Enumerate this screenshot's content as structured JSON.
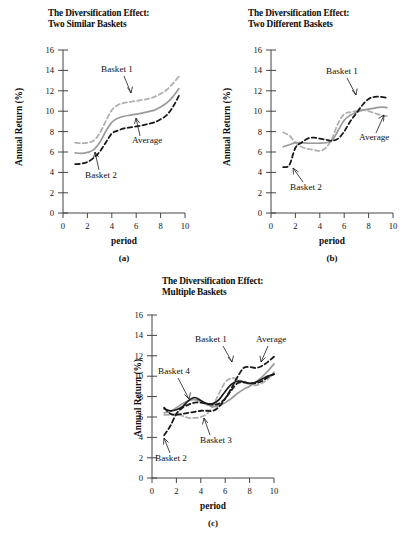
{
  "figure": {
    "background": "#ffffff",
    "common_axis": {
      "xlabel": "period",
      "ylabel": "Annual Return (%)",
      "xticks": [
        "0",
        "2",
        "4",
        "6",
        "8",
        "10"
      ],
      "yticks": [
        "0",
        "2",
        "4",
        "6",
        "8",
        "10",
        "12",
        "14",
        "16"
      ],
      "xlim": [
        0,
        10
      ],
      "ylim": [
        0,
        16
      ]
    },
    "colors": {
      "black": "#1a1a1a",
      "gray": "#9a9a9a",
      "light_gray": "#b0b0b0",
      "axis": "#444444"
    }
  },
  "panels": [
    {
      "id": "a",
      "caption": "(a)",
      "title": "The Diversification Effect:\nTwo Similar Baskets",
      "xlabel": "period",
      "ylabel": "Annual Return (%)",
      "annotations": [
        {
          "name": "basket-1",
          "text": "Basket 1"
        },
        {
          "name": "basket-2",
          "text": "Basket 2"
        },
        {
          "name": "average",
          "text": "Average"
        }
      ]
    },
    {
      "id": "b",
      "caption": "(b)",
      "title": "The Diversification Effect:\nTwo Different Baskets",
      "xlabel": "period",
      "ylabel": "Annual Return (%)",
      "annotations": [
        {
          "name": "basket-1",
          "text": "Basket 1"
        },
        {
          "name": "basket-2",
          "text": "Basket 2"
        },
        {
          "name": "average",
          "text": "Average"
        }
      ]
    },
    {
      "id": "c",
      "caption": "(c)",
      "title": "The Diversification Effect:\nMultiple Baskets",
      "xlabel": "period",
      "ylabel": "Annual Return (%)",
      "annotations": [
        {
          "name": "basket-1",
          "text": "Basket 1"
        },
        {
          "name": "basket-2",
          "text": "Basket 2"
        },
        {
          "name": "basket-3",
          "text": "Basket 3"
        },
        {
          "name": "basket-4",
          "text": "Basket 4"
        },
        {
          "name": "average",
          "text": "Average"
        }
      ]
    }
  ],
  "chart_data": [
    {
      "type": "line",
      "panel": "a",
      "title": "The Diversification Effect: Two Similar Baskets",
      "xlabel": "period",
      "ylabel": "Annual Return (%)",
      "xlim": [
        0,
        10
      ],
      "ylim": [
        0,
        16
      ],
      "xticks": [
        0,
        2,
        4,
        6,
        8,
        10
      ],
      "yticks": [
        0,
        2,
        4,
        6,
        8,
        10,
        12,
        14,
        16
      ],
      "grid": false,
      "legend": "inline-annotations",
      "x": [
        1.0,
        1.5,
        2.0,
        2.5,
        3.0,
        3.5,
        4.0,
        4.5,
        5.0,
        5.5,
        6.0,
        6.5,
        7.0,
        7.5,
        8.0,
        8.5,
        9.0,
        9.5
      ],
      "series": [
        {
          "name": "Basket 1",
          "style": "dashed",
          "color": "#b0b0b0",
          "values": [
            6.9,
            6.85,
            6.9,
            7.1,
            7.8,
            9.0,
            10.1,
            10.6,
            10.8,
            10.9,
            11.0,
            11.1,
            11.2,
            11.4,
            11.7,
            12.1,
            12.7,
            13.4
          ]
        },
        {
          "name": "Average",
          "style": "solid",
          "color": "#9a9a9a",
          "values": [
            5.9,
            5.85,
            5.95,
            6.2,
            6.9,
            8.0,
            8.9,
            9.3,
            9.5,
            9.6,
            9.7,
            9.8,
            9.95,
            10.1,
            10.4,
            10.8,
            11.4,
            12.2
          ]
        },
        {
          "name": "Basket 2",
          "style": "dashed",
          "color": "#1a1a1a",
          "values": [
            4.8,
            4.85,
            5.0,
            5.4,
            6.0,
            6.9,
            7.8,
            8.1,
            8.3,
            8.4,
            8.5,
            8.6,
            8.75,
            8.9,
            9.2,
            9.6,
            10.4,
            11.5
          ]
        }
      ]
    },
    {
      "type": "line",
      "panel": "b",
      "title": "The Diversification Effect: Two Different Baskets",
      "xlabel": "period",
      "ylabel": "Annual Return (%)",
      "xlim": [
        0,
        10
      ],
      "ylim": [
        0,
        16
      ],
      "xticks": [
        0,
        2,
        4,
        6,
        8,
        10
      ],
      "yticks": [
        0,
        2,
        4,
        6,
        8,
        10,
        12,
        14,
        16
      ],
      "grid": false,
      "legend": "inline-annotations",
      "x": [
        1.0,
        1.5,
        2.0,
        2.5,
        3.0,
        3.5,
        4.0,
        4.5,
        5.0,
        5.5,
        6.0,
        6.5,
        7.0,
        7.5,
        8.0,
        8.5,
        9.0,
        9.5
      ],
      "series": [
        {
          "name": "Basket 1",
          "style": "dashed",
          "color": "#b0b0b0",
          "values": [
            7.9,
            7.6,
            6.9,
            6.5,
            6.3,
            6.2,
            6.1,
            6.4,
            7.3,
            8.8,
            9.7,
            9.9,
            10.0,
            10.1,
            10.0,
            9.8,
            9.6,
            9.5
          ]
        },
        {
          "name": "Average",
          "style": "solid",
          "color": "#9a9a9a",
          "values": [
            6.5,
            6.7,
            6.9,
            6.9,
            6.85,
            6.85,
            6.85,
            6.9,
            7.1,
            8.1,
            9.1,
            9.6,
            9.9,
            10.1,
            10.2,
            10.3,
            10.4,
            10.35
          ]
        },
        {
          "name": "Basket 2",
          "style": "dashed",
          "color": "#1a1a1a",
          "values": [
            4.5,
            4.7,
            6.4,
            6.9,
            7.3,
            7.4,
            7.3,
            7.2,
            7.1,
            7.3,
            8.0,
            9.0,
            9.8,
            10.6,
            11.2,
            11.4,
            11.4,
            11.3
          ]
        }
      ]
    },
    {
      "type": "line",
      "panel": "c",
      "title": "The Diversification Effect: Multiple Baskets",
      "xlabel": "period",
      "ylabel": "Annual Return (%)",
      "xlim": [
        0,
        10
      ],
      "ylim": [
        0,
        16
      ],
      "xticks": [
        0,
        2,
        4,
        6,
        8,
        10
      ],
      "yticks": [
        0,
        2,
        4,
        6,
        8,
        10,
        12,
        14,
        16
      ],
      "grid": false,
      "legend": "inline-annotations",
      "x": [
        1.0,
        1.5,
        2.0,
        2.5,
        3.0,
        3.5,
        4.0,
        4.5,
        5.0,
        5.5,
        6.0,
        6.5,
        7.0,
        7.5,
        8.0,
        8.5,
        9.0,
        9.5,
        10.0
      ],
      "series": [
        {
          "name": "Basket 1",
          "style": "dashed",
          "color": "#1a1a1a",
          "values": [
            6.9,
            6.3,
            6.2,
            6.3,
            6.4,
            6.5,
            6.6,
            6.6,
            6.6,
            7.0,
            7.8,
            8.8,
            9.9,
            10.8,
            10.9,
            10.8,
            11.0,
            11.4,
            11.9
          ]
        },
        {
          "name": "Basket 2",
          "style": "dashed",
          "color": "#1a1a1a",
          "values": [
            4.2,
            5.1,
            6.3,
            6.9,
            7.2,
            7.4,
            7.4,
            7.3,
            7.2,
            7.3,
            7.8,
            8.6,
            9.3,
            9.4,
            9.3,
            9.3,
            9.5,
            9.9,
            10.2
          ]
        },
        {
          "name": "Basket 3",
          "style": "dashed",
          "color": "#b0b0b0",
          "values": [
            6.2,
            6.2,
            6.3,
            6.1,
            5.9,
            5.9,
            6.0,
            6.3,
            7.1,
            8.3,
            9.4,
            9.8,
            9.7,
            9.4,
            9.2,
            9.1,
            9.3,
            9.7,
            10.4
          ]
        },
        {
          "name": "Basket 4",
          "style": "solid",
          "color": "#9a9a9a",
          "values": [
            6.4,
            6.5,
            6.9,
            7.3,
            7.6,
            7.7,
            7.5,
            7.2,
            7.0,
            7.1,
            7.4,
            7.8,
            8.3,
            8.7,
            9.0,
            9.4,
            9.9,
            10.5,
            11.2
          ]
        },
        {
          "name": "Average",
          "style": "solid",
          "color": "#1a1a1a",
          "values": [
            6.8,
            6.6,
            6.7,
            7.0,
            7.6,
            7.9,
            7.6,
            7.3,
            7.3,
            7.7,
            8.5,
            9.2,
            9.5,
            9.45,
            9.3,
            9.4,
            9.7,
            10.0,
            10.2
          ]
        }
      ]
    }
  ]
}
